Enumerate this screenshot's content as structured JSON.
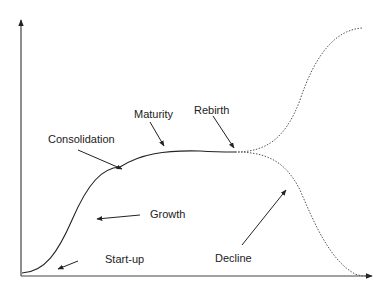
{
  "diagram": {
    "stroke_color": "#222222",
    "labels": {
      "startup": "Start-up",
      "growth": "Growth",
      "consolidation": "Consolidation",
      "maturity": "Maturity",
      "rebirth": "Rebirth",
      "decline": "Decline"
    }
  }
}
